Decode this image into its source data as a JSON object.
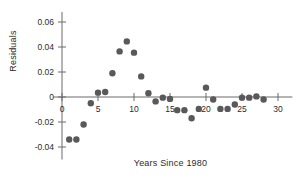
{
  "chart_data": {
    "type": "scatter",
    "title": "",
    "xlabel": "Years Since 1980",
    "ylabel": "Residuals",
    "xlim": [
      -1.5,
      32
    ],
    "ylim": [
      -0.05,
      0.068
    ],
    "xticks": [
      0,
      5,
      10,
      15,
      20,
      25,
      30
    ],
    "xticklabels": [
      "0",
      "5",
      "10",
      "15",
      "20",
      "25",
      "30"
    ],
    "yticks": [
      -0.04,
      -0.02,
      0,
      0.02,
      0.04,
      0.06
    ],
    "yticklabels": [
      "-0.04",
      "-0.02",
      "0",
      "0.02",
      "0.04",
      "0.06"
    ],
    "grid": false,
    "legend": null,
    "marker": {
      "shape": "circle",
      "color": "#595959",
      "size_px": 3.2
    },
    "axis_color": "#6b6b6b",
    "points": [
      {
        "x": 1,
        "y": -0.034
      },
      {
        "x": 2,
        "y": -0.034
      },
      {
        "x": 3,
        "y": -0.022
      },
      {
        "x": 4,
        "y": -0.005
      },
      {
        "x": 5,
        "y": 0.0035
      },
      {
        "x": 6,
        "y": 0.004
      },
      {
        "x": 7,
        "y": 0.019
      },
      {
        "x": 8,
        "y": 0.0365
      },
      {
        "x": 9,
        "y": 0.0445
      },
      {
        "x": 10,
        "y": 0.0355
      },
      {
        "x": 11,
        "y": 0.0165
      },
      {
        "x": 12,
        "y": 0.003
      },
      {
        "x": 13,
        "y": -0.0035
      },
      {
        "x": 14,
        "y": -0.0005
      },
      {
        "x": 15,
        "y": -0.0015
      },
      {
        "x": 16,
        "y": -0.0105
      },
      {
        "x": 17,
        "y": -0.0105
      },
      {
        "x": 18,
        "y": -0.017
      },
      {
        "x": 19,
        "y": -0.0095
      },
      {
        "x": 20,
        "y": 0.0075
      },
      {
        "x": 21,
        "y": -0.002
      },
      {
        "x": 22,
        "y": -0.0095
      },
      {
        "x": 23,
        "y": -0.0095
      },
      {
        "x": 24,
        "y": -0.006
      },
      {
        "x": 25,
        "y": -0.0005
      },
      {
        "x": 26,
        "y": -0.0005
      },
      {
        "x": 27,
        "y": 0.0005
      },
      {
        "x": 28,
        "y": -0.002
      }
    ]
  }
}
